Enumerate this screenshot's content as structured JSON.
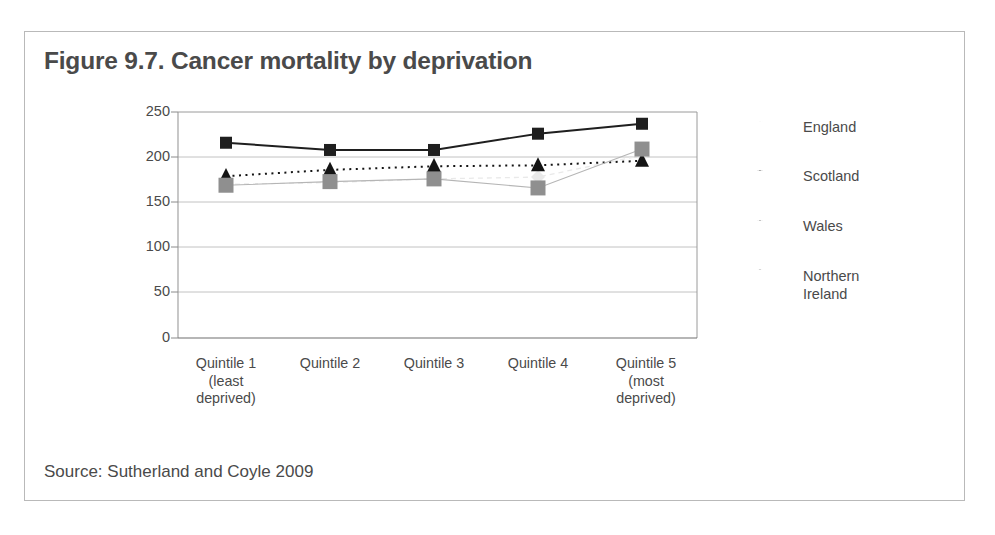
{
  "figure": {
    "title": "Figure 9.7. Cancer mortality by deprivation",
    "source": "Source: Sutherland and Coyle 2009"
  },
  "chart_data": {
    "type": "line",
    "title": "Figure 9.7. Cancer mortality by deprivation",
    "xlabel": "",
    "ylabel": "",
    "ylim": [
      0,
      250
    ],
    "yticks": [
      0,
      50,
      100,
      150,
      200,
      250
    ],
    "ytick_labels": [
      "0",
      "50",
      "100",
      "150",
      "200",
      "250"
    ],
    "grid": true,
    "legend_position": "right",
    "categories": [
      "Quintile 1 (least deprived)",
      "Quintile 2",
      "Quintile 3",
      "Quintile 4",
      "Quintile 5 (most deprived)"
    ],
    "category_lines": [
      [
        "Quintile 1",
        "(least",
        "deprived)"
      ],
      [
        "Quintile 2"
      ],
      [
        "Quintile 3"
      ],
      [
        "Quintile 4"
      ],
      [
        "Quintile 5",
        "(most",
        "deprived)"
      ]
    ],
    "series": [
      {
        "name": "England",
        "values": [
          170,
          172,
          176,
          178,
          202
        ],
        "color": "#e9e9e9",
        "marker": "diamond",
        "linestyle": "dashed"
      },
      {
        "name": "Scotland",
        "values": [
          216,
          208,
          208,
          226,
          237
        ],
        "color": "#1f1f1f",
        "marker": "square",
        "linestyle": "solid"
      },
      {
        "name": "Wales",
        "values": [
          179,
          186,
          190,
          191,
          196
        ],
        "color": "#141414",
        "marker": "triangle",
        "linestyle": "dotted"
      },
      {
        "name": "Northern Ireland",
        "values": [
          169,
          173,
          176,
          166,
          209
        ],
        "color": "#8f8f8f",
        "marker": "square",
        "linestyle": "solid-thin"
      }
    ]
  },
  "legend": {
    "entries": [
      {
        "label": "England",
        "icon": "diamond-marker-icon"
      },
      {
        "label": "Scotland",
        "icon": "square-marker-icon"
      },
      {
        "label": "Wales",
        "icon": "triangle-marker-icon"
      },
      {
        "label": "Northern\nIreland",
        "icon": "square-marker-icon"
      }
    ]
  },
  "axis": {
    "y_labels": [
      "250",
      "200",
      "150",
      "100",
      "50",
      "0"
    ],
    "y_positions": [
      112,
      157,
      202,
      247,
      292,
      338
    ]
  }
}
